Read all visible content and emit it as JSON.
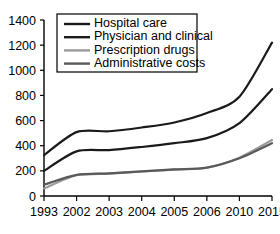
{
  "chart_data": {
    "type": "line",
    "title": "",
    "xlabel": "",
    "ylabel": "",
    "categories": [
      "1993",
      "2002",
      "2003",
      "2004",
      "2005",
      "2006",
      "2010",
      "2015"
    ],
    "ylim": [
      0,
      1400
    ],
    "yticks": [
      0,
      200,
      400,
      600,
      800,
      1000,
      1200,
      1400
    ],
    "ytick_labels": [
      "0",
      "200",
      "400",
      "600",
      "800",
      "1000",
      "1200",
      "1400"
    ],
    "grid": false,
    "legend_position": "top-left",
    "series": [
      {
        "name": "Hospital care",
        "color": "#1a1a1a",
        "width": 2.2,
        "values": [
          325,
          508,
          515,
          545,
          585,
          660,
          790,
          1220
        ]
      },
      {
        "name": "Physician and clinical",
        "color": "#1a1a1a",
        "width": 2.2,
        "values": [
          200,
          355,
          365,
          390,
          420,
          460,
          580,
          850
        ]
      },
      {
        "name": "Prescription drugs",
        "color": "#9a9a9a",
        "width": 2.2,
        "values": [
          60,
          165,
          178,
          195,
          210,
          225,
          305,
          445
        ]
      },
      {
        "name": "Administrative costs",
        "color": "#5a5a5a",
        "width": 2.2,
        "values": [
          90,
          168,
          180,
          196,
          211,
          226,
          300,
          420
        ]
      }
    ]
  },
  "legend": {
    "items": [
      {
        "label": "Hospital care",
        "color": "#1a1a1a"
      },
      {
        "label": "Physician and clinical",
        "color": "#1a1a1a"
      },
      {
        "label": "Prescription drugs",
        "color": "#9a9a9a"
      },
      {
        "label": "Administrative costs",
        "color": "#5a5a5a"
      }
    ]
  }
}
